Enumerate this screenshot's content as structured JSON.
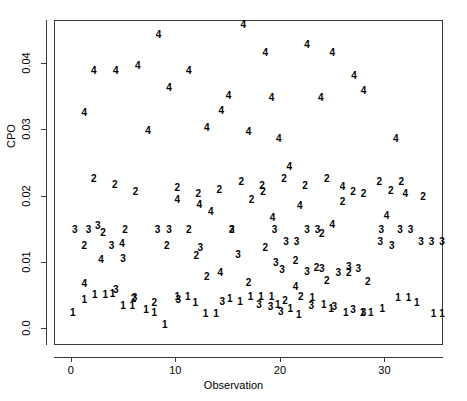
{
  "chart_data": {
    "type": "scatter",
    "title": "",
    "xlabel": "Observation",
    "ylabel": "CPO",
    "xlim": [
      -1.6,
      35.6
    ],
    "ylim": [
      -0.0025,
      0.0465
    ],
    "xticks": [
      0,
      10,
      20,
      30
    ],
    "xticklabels": [
      "0",
      "10",
      "20",
      "30"
    ],
    "yticks": [
      0.0,
      0.01,
      0.02,
      0.03,
      0.04
    ],
    "yticklabels": [
      "0.0",
      "0.01",
      "0.02",
      "0.03",
      "0.04"
    ],
    "grid": false,
    "legend": false,
    "marker_style": "text-digit-group-label",
    "groups": [
      "1",
      "2",
      "3",
      "4"
    ],
    "note": "Each plotted point is drawn as the digit of its group number.",
    "points": [
      {
        "label": "4",
        "x": 1.3,
        "y": 0.0325
      },
      {
        "label": "4",
        "x": 2.2,
        "y": 0.0388
      },
      {
        "label": "4",
        "x": 4.3,
        "y": 0.0388
      },
      {
        "label": "4",
        "x": 6.4,
        "y": 0.0396
      },
      {
        "label": "4",
        "x": 8.4,
        "y": 0.0442
      },
      {
        "label": "4",
        "x": 7.4,
        "y": 0.0298
      },
      {
        "label": "4",
        "x": 9.4,
        "y": 0.0363
      },
      {
        "label": "4",
        "x": 11.3,
        "y": 0.0388
      },
      {
        "label": "4",
        "x": 14.4,
        "y": 0.0328
      },
      {
        "label": "4",
        "x": 13.0,
        "y": 0.0302
      },
      {
        "label": "4",
        "x": 16.5,
        "y": 0.0458
      },
      {
        "label": "4",
        "x": 18.6,
        "y": 0.0415
      },
      {
        "label": "4",
        "x": 22.6,
        "y": 0.0428
      },
      {
        "label": "4",
        "x": 15.1,
        "y": 0.0351
      },
      {
        "label": "4",
        "x": 19.2,
        "y": 0.0348
      },
      {
        "label": "4",
        "x": 17.0,
        "y": 0.0296
      },
      {
        "label": "4",
        "x": 25.0,
        "y": 0.0415
      },
      {
        "label": "4",
        "x": 27.1,
        "y": 0.038
      },
      {
        "label": "4",
        "x": 28.0,
        "y": 0.0358
      },
      {
        "label": "4",
        "x": 23.9,
        "y": 0.0348
      },
      {
        "label": "4",
        "x": 19.9,
        "y": 0.0285
      },
      {
        "label": "4",
        "x": 31.1,
        "y": 0.0285
      },
      {
        "label": "4",
        "x": 20.9,
        "y": 0.0243
      },
      {
        "label": "4",
        "x": 26.0,
        "y": 0.0213
      },
      {
        "label": "4",
        "x": 32.0,
        "y": 0.0203
      },
      {
        "label": "4",
        "x": 21.9,
        "y": 0.0185
      },
      {
        "label": "4",
        "x": 10.2,
        "y": 0.0193
      },
      {
        "label": "4",
        "x": 12.3,
        "y": 0.0186
      },
      {
        "label": "4",
        "x": 13.4,
        "y": 0.0175
      },
      {
        "label": "4",
        "x": 19.3,
        "y": 0.0166
      },
      {
        "label": "4",
        "x": 30.2,
        "y": 0.017
      },
      {
        "label": "4",
        "x": 25.0,
        "y": 0.0156
      },
      {
        "label": "4",
        "x": 4.9,
        "y": 0.0127
      },
      {
        "label": "4",
        "x": 2.9,
        "y": 0.0103
      },
      {
        "label": "4",
        "x": 14.3,
        "y": 0.0084
      },
      {
        "label": "4",
        "x": 1.3,
        "y": 0.0067
      },
      {
        "label": "4",
        "x": 21.5,
        "y": 0.0063
      },
      {
        "label": "2",
        "x": 2.2,
        "y": 0.0226
      },
      {
        "label": "2",
        "x": 4.2,
        "y": 0.0216
      },
      {
        "label": "2",
        "x": 6.2,
        "y": 0.0205
      },
      {
        "label": "2",
        "x": 10.2,
        "y": 0.0212
      },
      {
        "label": "2",
        "x": 12.2,
        "y": 0.0203
      },
      {
        "label": "2",
        "x": 14.2,
        "y": 0.0209
      },
      {
        "label": "2",
        "x": 16.3,
        "y": 0.0221
      },
      {
        "label": "2",
        "x": 18.3,
        "y": 0.0215
      },
      {
        "label": "2",
        "x": 17.3,
        "y": 0.0193
      },
      {
        "label": "2",
        "x": 18.4,
        "y": 0.0205
      },
      {
        "label": "2",
        "x": 20.4,
        "y": 0.0226
      },
      {
        "label": "2",
        "x": 22.4,
        "y": 0.0215
      },
      {
        "label": "2",
        "x": 24.5,
        "y": 0.0226
      },
      {
        "label": "2",
        "x": 26.0,
        "y": 0.019
      },
      {
        "label": "2",
        "x": 27.0,
        "y": 0.0205
      },
      {
        "label": "2",
        "x": 28.0,
        "y": 0.0203
      },
      {
        "label": "2",
        "x": 29.5,
        "y": 0.0221
      },
      {
        "label": "2",
        "x": 30.6,
        "y": 0.0207
      },
      {
        "label": "2",
        "x": 31.6,
        "y": 0.0221
      },
      {
        "label": "2",
        "x": 33.7,
        "y": 0.0198
      },
      {
        "label": "2",
        "x": 3.1,
        "y": 0.0144
      },
      {
        "label": "2",
        "x": 5.2,
        "y": 0.0148
      },
      {
        "label": "2",
        "x": 11.3,
        "y": 0.0148
      },
      {
        "label": "2",
        "x": 15.4,
        "y": 0.0148
      },
      {
        "label": "2",
        "x": 24.0,
        "y": 0.0143
      },
      {
        "label": "2",
        "x": 1.3,
        "y": 0.0125
      },
      {
        "label": "2",
        "x": 9.2,
        "y": 0.0124
      },
      {
        "label": "2",
        "x": 12.0,
        "y": 0.0109
      },
      {
        "label": "2",
        "x": 18.6,
        "y": 0.0122
      },
      {
        "label": "2",
        "x": 21.5,
        "y": 0.0101
      },
      {
        "label": "2",
        "x": 23.5,
        "y": 0.0091
      },
      {
        "label": "2",
        "x": 26.6,
        "y": 0.0083
      },
      {
        "label": "2",
        "x": 13.0,
        "y": 0.0078
      },
      {
        "label": "2",
        "x": 17.0,
        "y": 0.0068
      },
      {
        "label": "2",
        "x": 24.5,
        "y": 0.0072
      },
      {
        "label": "2",
        "x": 28.4,
        "y": 0.007
      },
      {
        "label": "2",
        "x": 6.0,
        "y": 0.0044
      },
      {
        "label": "2",
        "x": 8.0,
        "y": 0.0039
      },
      {
        "label": "2",
        "x": 22.0,
        "y": 0.0048
      },
      {
        "label": "2",
        "x": 20.5,
        "y": 0.0041
      },
      {
        "label": "3",
        "x": 0.4,
        "y": 0.0148
      },
      {
        "label": "3",
        "x": 1.7,
        "y": 0.0148
      },
      {
        "label": "3",
        "x": 2.6,
        "y": 0.0155
      },
      {
        "label": "3",
        "x": 8.3,
        "y": 0.0148
      },
      {
        "label": "3",
        "x": 9.4,
        "y": 0.0148
      },
      {
        "label": "3",
        "x": 15.4,
        "y": 0.0148
      },
      {
        "label": "3",
        "x": 19.5,
        "y": 0.0148
      },
      {
        "label": "3",
        "x": 20.6,
        "y": 0.0131
      },
      {
        "label": "3",
        "x": 21.6,
        "y": 0.0131
      },
      {
        "label": "3",
        "x": 22.6,
        "y": 0.0148
      },
      {
        "label": "3",
        "x": 23.6,
        "y": 0.0148
      },
      {
        "label": "3",
        "x": 29.7,
        "y": 0.0148
      },
      {
        "label": "3",
        "x": 31.5,
        "y": 0.0148
      },
      {
        "label": "3",
        "x": 32.5,
        "y": 0.0148
      },
      {
        "label": "3",
        "x": 33.5,
        "y": 0.0131
      },
      {
        "label": "3",
        "x": 34.5,
        "y": 0.0131
      },
      {
        "label": "3",
        "x": 35.5,
        "y": 0.0131
      },
      {
        "label": "3",
        "x": 29.6,
        "y": 0.0131
      },
      {
        "label": "3",
        "x": 30.7,
        "y": 0.0124
      },
      {
        "label": "3",
        "x": 3.9,
        "y": 0.0124
      },
      {
        "label": "3",
        "x": 5.0,
        "y": 0.0105
      },
      {
        "label": "3",
        "x": 12.4,
        "y": 0.0122
      },
      {
        "label": "3",
        "x": 16.0,
        "y": 0.0111
      },
      {
        "label": "3",
        "x": 19.6,
        "y": 0.0098
      },
      {
        "label": "3",
        "x": 20.2,
        "y": 0.0088
      },
      {
        "label": "3",
        "x": 22.6,
        "y": 0.0085
      },
      {
        "label": "3",
        "x": 24.0,
        "y": 0.009
      },
      {
        "label": "3",
        "x": 25.6,
        "y": 0.0084
      },
      {
        "label": "3",
        "x": 26.6,
        "y": 0.0093
      },
      {
        "label": "3",
        "x": 27.5,
        "y": 0.009
      },
      {
        "label": "3",
        "x": 4.3,
        "y": 0.0058
      },
      {
        "label": "3",
        "x": 6.1,
        "y": 0.0046
      },
      {
        "label": "3",
        "x": 10.3,
        "y": 0.0043
      },
      {
        "label": "3",
        "x": 14.5,
        "y": 0.004
      },
      {
        "label": "3",
        "x": 18.0,
        "y": 0.0035
      },
      {
        "label": "3",
        "x": 19.1,
        "y": 0.0032
      },
      {
        "label": "3",
        "x": 20.1,
        "y": 0.0025
      },
      {
        "label": "3",
        "x": 23.0,
        "y": 0.0034
      },
      {
        "label": "3",
        "x": 25.2,
        "y": 0.0033
      },
      {
        "label": "3",
        "x": 27.0,
        "y": 0.0028
      },
      {
        "label": "3",
        "x": 28.0,
        "y": 0.0024
      },
      {
        "label": "1",
        "x": 0.2,
        "y": 0.0023
      },
      {
        "label": "1",
        "x": 1.3,
        "y": 0.0043
      },
      {
        "label": "1",
        "x": 2.3,
        "y": 0.005
      },
      {
        "label": "1",
        "x": 3.3,
        "y": 0.005
      },
      {
        "label": "1",
        "x": 4.0,
        "y": 0.0052
      },
      {
        "label": "1",
        "x": 5.0,
        "y": 0.0034
      },
      {
        "label": "1",
        "x": 5.9,
        "y": 0.0034
      },
      {
        "label": "1",
        "x": 7.2,
        "y": 0.0028
      },
      {
        "label": "1",
        "x": 8.0,
        "y": 0.0023
      },
      {
        "label": "1",
        "x": 9.0,
        "y": 0.0005
      },
      {
        "label": "1",
        "x": 10.2,
        "y": 0.0048
      },
      {
        "label": "1",
        "x": 11.2,
        "y": 0.0048
      },
      {
        "label": "1",
        "x": 11.9,
        "y": 0.0038
      },
      {
        "label": "1",
        "x": 12.9,
        "y": 0.0022
      },
      {
        "label": "1",
        "x": 13.9,
        "y": 0.0022
      },
      {
        "label": "1",
        "x": 15.2,
        "y": 0.0044
      },
      {
        "label": "1",
        "x": 16.2,
        "y": 0.004
      },
      {
        "label": "1",
        "x": 17.2,
        "y": 0.0048
      },
      {
        "label": "1",
        "x": 18.2,
        "y": 0.0048
      },
      {
        "label": "1",
        "x": 19.2,
        "y": 0.0048
      },
      {
        "label": "1",
        "x": 19.8,
        "y": 0.0035
      },
      {
        "label": "1",
        "x": 21.0,
        "y": 0.003
      },
      {
        "label": "1",
        "x": 21.8,
        "y": 0.002
      },
      {
        "label": "1",
        "x": 23.1,
        "y": 0.0046
      },
      {
        "label": "1",
        "x": 24.2,
        "y": 0.0036
      },
      {
        "label": "1",
        "x": 24.9,
        "y": 0.003
      },
      {
        "label": "1",
        "x": 26.3,
        "y": 0.0024
      },
      {
        "label": "1",
        "x": 27.9,
        "y": 0.0024
      },
      {
        "label": "1",
        "x": 28.7,
        "y": 0.0024
      },
      {
        "label": "1",
        "x": 29.8,
        "y": 0.003
      },
      {
        "label": "1",
        "x": 31.3,
        "y": 0.0046
      },
      {
        "label": "1",
        "x": 32.3,
        "y": 0.0046
      },
      {
        "label": "1",
        "x": 33.1,
        "y": 0.0038
      },
      {
        "label": "1",
        "x": 34.7,
        "y": 0.0022
      },
      {
        "label": "1",
        "x": 35.5,
        "y": 0.0022
      }
    ]
  },
  "axes": {
    "x_title": "Observation",
    "y_title": "CPO",
    "x_tick_labels": [
      "0",
      "10",
      "20",
      "30"
    ],
    "y_tick_labels": [
      "0.0",
      "0.01",
      "0.02",
      "0.03",
      "0.04"
    ]
  },
  "colors": {
    "frame": "#3b3b3b",
    "text": "#000000",
    "background": "#ffffff"
  }
}
